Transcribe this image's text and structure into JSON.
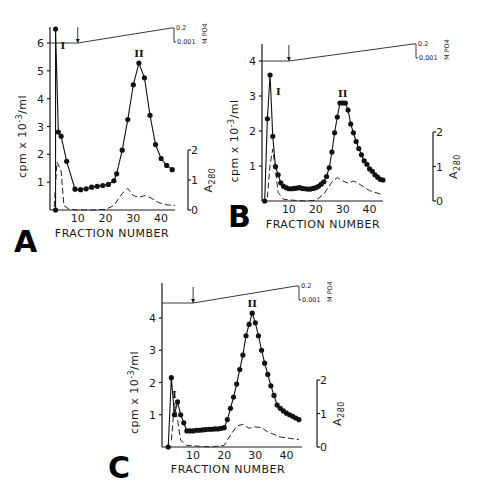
{
  "chart_data": [
    {
      "type": "line",
      "panel": "A",
      "title": "",
      "xlabel": "FRACTION NUMBER",
      "ylabel": "cpm x 10^-3/ml",
      "y2label": "A280",
      "gradient_label": "M PO4",
      "gradient_range_labels": [
        "0.2",
        "0.001"
      ],
      "xlim": [
        0,
        45
      ],
      "ylim": [
        0,
        6.5
      ],
      "y2lim": [
        0,
        2
      ],
      "xticks": [
        "10",
        "20",
        "30",
        "40"
      ],
      "yticks": [
        "1",
        "2",
        "3",
        "4",
        "5",
        "6"
      ],
      "y2ticks": [
        "0",
        "1",
        "2"
      ],
      "gradient_start_fraction": 10,
      "peak_labels": [
        {
          "label": "I",
          "x": 3.5
        },
        {
          "label": "II",
          "x": 32
        }
      ],
      "series": [
        {
          "name": "cpm",
          "style": "solid-dots",
          "x": [
            2,
            2,
            3,
            4,
            6,
            9,
            11,
            13,
            15,
            17,
            19,
            21,
            23,
            24,
            26,
            28,
            30,
            32,
            34,
            36,
            38,
            40,
            42,
            44
          ],
          "y": [
            0,
            6.5,
            2.8,
            2.65,
            1.75,
            0.75,
            0.73,
            0.76,
            0.82,
            0.85,
            0.88,
            0.92,
            1.05,
            1.3,
            2.15,
            3.25,
            4.5,
            5.28,
            4.75,
            3.4,
            2.35,
            1.85,
            1.6,
            1.45
          ]
        },
        {
          "name": "A280",
          "style": "dashed",
          "x": [
            1.5,
            2.5,
            4,
            5,
            7,
            10,
            15,
            20,
            23,
            26,
            28,
            30,
            32,
            34,
            36,
            39,
            42,
            45
          ],
          "y": [
            0.1,
            1.6,
            1.3,
            0.15,
            0.02,
            0.0,
            0.0,
            0.02,
            0.15,
            0.55,
            0.72,
            0.48,
            0.42,
            0.48,
            0.42,
            0.25,
            0.17,
            0.15
          ]
        }
      ]
    },
    {
      "type": "line",
      "panel": "B",
      "title": "",
      "xlabel": "FRACTION NUMBER",
      "ylabel": "cpm x 10^-3/ml",
      "y2label": "A280",
      "gradient_label": "M PO4",
      "gradient_range_labels": [
        "0.2",
        "0.001"
      ],
      "xlim": [
        0,
        45
      ],
      "ylim": [
        0,
        4.5
      ],
      "y2lim": [
        0,
        2
      ],
      "xticks": [
        "10",
        "20",
        "30",
        "40"
      ],
      "yticks": [
        "1",
        "2",
        "3",
        "4"
      ],
      "y2ticks": [
        "0",
        "1",
        "2"
      ],
      "gradient_start_fraction": 10,
      "peak_labels": [
        {
          "label": "I",
          "x": 5
        },
        {
          "label": "II",
          "x": 30
        }
      ],
      "series": [
        {
          "name": "cpm",
          "style": "solid-dots",
          "x": [
            1,
            2,
            3,
            4,
            5,
            6,
            7,
            8,
            9,
            10,
            11,
            12,
            13,
            14,
            15,
            16,
            17,
            18,
            19,
            20,
            21,
            22,
            23,
            24,
            25,
            26,
            27,
            28,
            29,
            30,
            31,
            32,
            33,
            34,
            35,
            36,
            37,
            38,
            39,
            40,
            41,
            42,
            43,
            44,
            45
          ],
          "y": [
            0,
            2.35,
            3.6,
            1.85,
            0.98,
            0.75,
            0.52,
            0.42,
            0.38,
            0.35,
            0.35,
            0.36,
            0.37,
            0.38,
            0.36,
            0.35,
            0.34,
            0.34,
            0.36,
            0.38,
            0.42,
            0.48,
            0.55,
            0.7,
            0.95,
            1.4,
            1.95,
            2.4,
            2.8,
            2.8,
            2.8,
            2.6,
            2.2,
            1.95,
            1.7,
            1.5,
            1.32,
            1.15,
            1.05,
            0.92,
            0.85,
            0.75,
            0.68,
            0.62,
            0.6
          ]
        },
        {
          "name": "A280",
          "style": "dashed",
          "x": [
            2,
            3,
            4,
            5,
            6,
            8,
            12,
            16,
            20,
            23,
            26,
            28,
            30,
            32,
            34,
            36,
            40,
            45
          ],
          "y": [
            0.1,
            1.05,
            1.5,
            0.9,
            0.25,
            0.05,
            0.02,
            0.0,
            0.02,
            0.2,
            0.55,
            0.68,
            0.58,
            0.52,
            0.58,
            0.5,
            0.3,
            0.18
          ]
        }
      ]
    },
    {
      "type": "line",
      "panel": "C",
      "title": "",
      "xlabel": "FRACTION NUMBER",
      "ylabel": "cpm x 10^-3/ml",
      "y2label": "A280",
      "gradient_label": "M PO4",
      "gradient_range_labels": [
        "0.2",
        "0.001"
      ],
      "xlim": [
        0,
        45
      ],
      "ylim": [
        0,
        4.6
      ],
      "y2lim": [
        0,
        2
      ],
      "xticks": [
        "10",
        "20",
        "30",
        "40"
      ],
      "yticks": [
        "1",
        "2",
        "3",
        "4"
      ],
      "y2ticks": [
        "0",
        "1",
        "2"
      ],
      "gradient_start_fraction": 10,
      "peak_labels": [
        {
          "label": "I",
          "x": 3
        },
        {
          "label": "II",
          "x": 29
        }
      ],
      "series": [
        {
          "name": "cpm",
          "style": "solid-dots",
          "x": [
            2,
            3,
            4,
            5,
            6,
            7,
            8,
            9,
            10,
            11,
            12,
            13,
            14,
            15,
            16,
            17,
            18,
            19,
            20,
            21,
            22,
            23,
            24,
            25,
            26,
            27,
            28,
            29,
            30,
            31,
            32,
            33,
            34,
            35,
            36,
            37,
            38,
            39,
            40,
            41,
            42,
            43,
            44
          ],
          "y": [
            0,
            2.15,
            1.0,
            1.4,
            1.0,
            0.75,
            0.5,
            0.5,
            0.5,
            0.52,
            0.52,
            0.53,
            0.54,
            0.55,
            0.55,
            0.56,
            0.56,
            0.58,
            0.6,
            0.85,
            1.2,
            1.55,
            1.95,
            2.4,
            2.85,
            3.45,
            3.8,
            4.15,
            3.85,
            3.45,
            3.0,
            2.6,
            2.25,
            1.9,
            1.6,
            1.3,
            1.2,
            1.12,
            1.05,
            1.0,
            0.95,
            0.9,
            0.85
          ]
        },
        {
          "name": "A280",
          "style": "dashed",
          "x": [
            3,
            4,
            5,
            6,
            8,
            12,
            16,
            20,
            22,
            24,
            26,
            28,
            30,
            32,
            34,
            38,
            44
          ],
          "y": [
            0.2,
            1.3,
            0.8,
            0.2,
            0.05,
            0.02,
            0.0,
            0.05,
            0.35,
            0.62,
            0.68,
            0.56,
            0.6,
            0.58,
            0.45,
            0.3,
            0.22
          ]
        }
      ]
    }
  ],
  "panels": {
    "A": {
      "letter": "A",
      "xlabel": "FRACTION NUMBER"
    },
    "B": {
      "letter": "B",
      "xlabel": "FRACTION NUMBER"
    },
    "C": {
      "letter": "C",
      "xlabel": "FRACTION NUMBER"
    }
  }
}
